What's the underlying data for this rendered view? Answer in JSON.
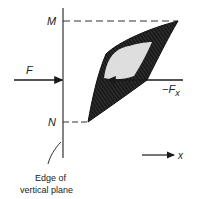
{
  "diagram": {
    "labels": {
      "M": "M",
      "N": "N",
      "F": "F",
      "neg_Fx_prefix": "−F",
      "neg_Fx_sub": "x",
      "x_axis": "x",
      "edge_line1": "Edge of",
      "edge_line2": "vertical plane"
    },
    "colors": {
      "ink": "#1a1a1a",
      "fill": "#111111",
      "background": "#ffffff"
    }
  }
}
